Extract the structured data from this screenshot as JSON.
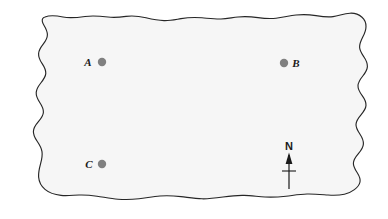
{
  "figure": {
    "kind": "sketch-map",
    "title": "",
    "background_color": "#ffffff",
    "land_fill_color": "#f6f6f6",
    "outline_color": "#262626",
    "point_color": "#808080",
    "label_color": "#1a1a1a"
  },
  "region": {
    "name": "land-area",
    "description": "irregular hand-drawn closed boundary"
  },
  "points": [
    {
      "id": "A",
      "label": "A",
      "label_side": "left",
      "dot_x": 102,
      "dot_y": 62,
      "label_x": 88,
      "label_y": 66,
      "radius": 4.2
    },
    {
      "id": "B",
      "label": "B",
      "label_side": "right",
      "dot_x": 284,
      "dot_y": 63,
      "label_x": 292,
      "label_y": 67,
      "radius": 4.2
    },
    {
      "id": "C",
      "label": "C",
      "label_side": "left",
      "dot_x": 102,
      "dot_y": 164,
      "label_x": 89,
      "label_y": 168,
      "radius": 4.2
    }
  ],
  "compass": {
    "label": "N",
    "label_x": 289,
    "label_y": 150,
    "shaft_x": 289,
    "shaft_top": 154,
    "shaft_bottom": 189,
    "crossbar_y": 171,
    "crossbar_half_width": 7,
    "arrow_tip_y": 153,
    "arrow_base_y": 163,
    "arrow_half_width": 3.6
  }
}
